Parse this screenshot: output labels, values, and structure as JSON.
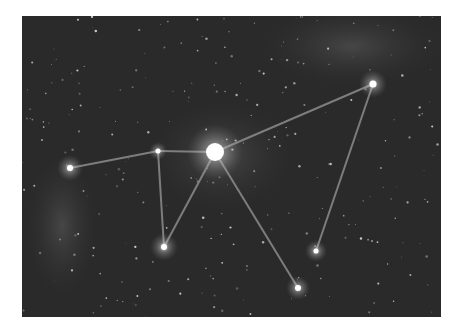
{
  "image": {
    "subject": "star field with constellation lines",
    "background_color": "#2b2b2b",
    "frame": {
      "x": 22,
      "y": 16,
      "width": 419,
      "height": 301
    },
    "stars": [
      {
        "id": "center",
        "x": 193,
        "y": 136,
        "r": 9,
        "glow": 28
      },
      {
        "id": "upper-right",
        "x": 351,
        "y": 68,
        "r": 3.5,
        "glow": 14
      },
      {
        "id": "left",
        "x": 48,
        "y": 152,
        "r": 3,
        "glow": 13
      },
      {
        "id": "mid-left",
        "x": 136,
        "y": 135,
        "r": 2.5,
        "glow": 9
      },
      {
        "id": "lower-left",
        "x": 142,
        "y": 231,
        "r": 3,
        "glow": 14
      },
      {
        "id": "lower-mid",
        "x": 276,
        "y": 272,
        "r": 3,
        "glow": 12
      },
      {
        "id": "lower-right",
        "x": 294,
        "y": 235,
        "r": 2.5,
        "glow": 11
      }
    ],
    "lines": [
      [
        "left",
        "mid-left"
      ],
      [
        "mid-left",
        "center"
      ],
      [
        "mid-left",
        "lower-left"
      ],
      [
        "lower-left",
        "center"
      ],
      [
        "center",
        "upper-right"
      ],
      [
        "center",
        "lower-mid"
      ],
      [
        "upper-right",
        "lower-right"
      ]
    ]
  }
}
